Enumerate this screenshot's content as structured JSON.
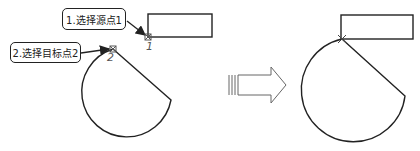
{
  "callouts": {
    "step1": "1.选择源点1",
    "step2": "2.选择目标点2"
  },
  "markers": {
    "point1": "1",
    "point2": "2"
  },
  "colors": {
    "stroke": "#222222",
    "marker": "#555555",
    "arrow_fill": "#ffffff"
  },
  "transition_arrow": "right-arrow"
}
